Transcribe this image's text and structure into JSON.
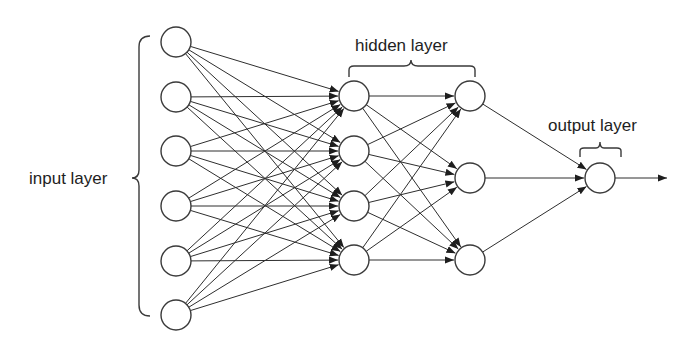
{
  "diagram": {
    "type": "feedforward-neural-network",
    "labels": {
      "input": "input layer",
      "hidden": "hidden layer",
      "output": "output layer"
    },
    "layers": [
      {
        "name": "input",
        "x": 176,
        "nodes": [
          42,
          97,
          151,
          206,
          261,
          315
        ]
      },
      {
        "name": "hidden-1",
        "x": 354,
        "nodes": [
          96,
          151,
          206,
          260
        ]
      },
      {
        "name": "hidden-2",
        "x": 470,
        "nodes": [
          96,
          178,
          260
        ]
      },
      {
        "name": "output",
        "x": 600,
        "nodes": [
          178
        ]
      }
    ],
    "node_radius": 15,
    "connections": "fully-connected",
    "output_arrow_end_x": 667,
    "colors": {
      "background": "#ffffff",
      "stroke": "#3a3a3a",
      "edge": "#2e2e2e",
      "text": "#1e1e1e"
    }
  }
}
